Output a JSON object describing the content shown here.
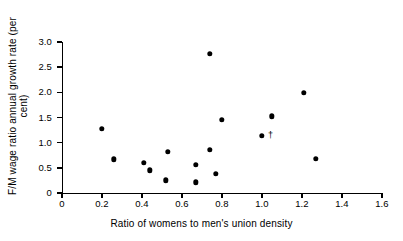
{
  "chart_data": {
    "type": "scatter",
    "title": "",
    "xlabel": "Ratio of womens to men's union density",
    "ylabel": "F/M wage ratio annual growth rate (per cent)",
    "xlim": [
      0,
      1.6
    ],
    "ylim": [
      0,
      3.0
    ],
    "xticks": [
      "0",
      "0.2",
      "0.4",
      "0.6",
      "0.8",
      "1.0",
      "1.2",
      "1.4",
      "1.6"
    ],
    "xtick_values": [
      0,
      0.2,
      0.4,
      0.6,
      0.8,
      1.0,
      1.2,
      1.4,
      1.6
    ],
    "yticks": [
      "0",
      "0.5",
      "1.0",
      "1.5",
      "2.0",
      "2.5",
      "3.0"
    ],
    "ytick_values": [
      0,
      0.5,
      1.0,
      1.5,
      2.0,
      2.5,
      3.0
    ],
    "grid": false,
    "legend": null,
    "marker": "filled-circle",
    "marker_color": "#000000",
    "points": [
      {
        "x": 0.2,
        "y": 1.27
      },
      {
        "x": 0.26,
        "y": 0.67
      },
      {
        "x": 0.41,
        "y": 0.6
      },
      {
        "x": 0.44,
        "y": 0.45
      },
      {
        "x": 0.52,
        "y": 0.25
      },
      {
        "x": 0.53,
        "y": 0.82
      },
      {
        "x": 0.67,
        "y": 0.56
      },
      {
        "x": 0.67,
        "y": 0.21
      },
      {
        "x": 0.74,
        "y": 0.86
      },
      {
        "x": 0.74,
        "y": 2.76
      },
      {
        "x": 0.77,
        "y": 0.38
      },
      {
        "x": 0.8,
        "y": 1.46
      },
      {
        "x": 1.0,
        "y": 1.14
      },
      {
        "x": 1.05,
        "y": 1.52
      },
      {
        "x": 1.21,
        "y": 1.99
      },
      {
        "x": 1.27,
        "y": 0.68
      }
    ],
    "annotations": [
      {
        "text": "†",
        "x": 1.03,
        "y": 1.16,
        "note": "dagger footnote marker beside the point at (1.00, 1.14)"
      }
    ]
  }
}
